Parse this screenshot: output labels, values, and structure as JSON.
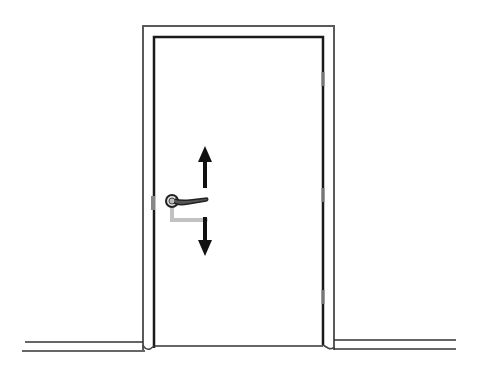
{
  "illustration": {
    "subject": "door-with-lever-handle",
    "arrows": [
      "up",
      "down"
    ],
    "colors": {
      "background": "#ffffff",
      "line": "#1a1a1a",
      "frame_line": "#555555",
      "handle_ghost": "#bdbdbd"
    }
  }
}
